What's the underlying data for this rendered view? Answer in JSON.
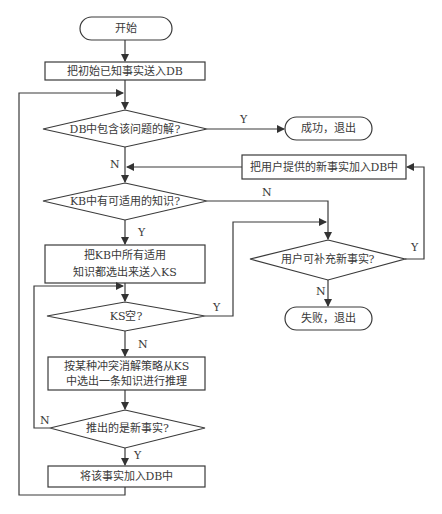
{
  "flowchart": {
    "nodes": {
      "start": {
        "type": "terminal",
        "text": "开始"
      },
      "init_facts": {
        "type": "process",
        "text": "把初始已知事实送入DB"
      },
      "db_contains": {
        "type": "decision",
        "text": "DB中包含该问题的解?"
      },
      "success": {
        "type": "terminal",
        "text": "成功，退出"
      },
      "add_user_facts": {
        "type": "process",
        "text": "把用户提供的新事实加入DB中"
      },
      "kb_applicable": {
        "type": "decision",
        "text": "KB中有可适用的知识?"
      },
      "select_to_ks": {
        "type": "process",
        "line1": "把KB中所有适用",
        "line2": "知识都选出来送入KS"
      },
      "ks_empty": {
        "type": "decision",
        "text": "KS空?"
      },
      "resolve_conflict": {
        "type": "process",
        "line1": "按某种冲突消解策略从KS",
        "line2": "中选出一条知识进行推理"
      },
      "new_fact": {
        "type": "decision",
        "text": "推出的是新事实?"
      },
      "add_fact_db": {
        "type": "process",
        "text": "将该事实加入DB中"
      },
      "user_can_add": {
        "type": "decision",
        "text": "用户可补充新事实?"
      },
      "fail": {
        "type": "terminal",
        "text": "失败，退出"
      }
    },
    "edge_labels": {
      "db_yes": "Y",
      "db_no": "N",
      "kb_yes": "Y",
      "kb_no": "N",
      "ks_yes": "Y",
      "ks_no": "N",
      "new_yes": "Y",
      "new_no": "N",
      "user_yes": "Y",
      "user_no": "N"
    },
    "edges": [
      [
        "start",
        "init_facts"
      ],
      [
        "init_facts",
        "db_contains"
      ],
      [
        "db_contains",
        "success",
        "Y"
      ],
      [
        "db_contains",
        "kb_applicable",
        "N"
      ],
      [
        "add_user_facts",
        "kb_applicable"
      ],
      [
        "kb_applicable",
        "select_to_ks",
        "Y"
      ],
      [
        "kb_applicable",
        "user_can_add",
        "N"
      ],
      [
        "select_to_ks",
        "ks_empty"
      ],
      [
        "ks_empty",
        "user_can_add",
        "Y"
      ],
      [
        "ks_empty",
        "resolve_conflict",
        "N"
      ],
      [
        "resolve_conflict",
        "new_fact"
      ],
      [
        "new_fact",
        "add_fact_db",
        "Y"
      ],
      [
        "new_fact",
        "ks_empty",
        "N"
      ],
      [
        "add_fact_db",
        "db_contains"
      ],
      [
        "user_can_add",
        "add_user_facts",
        "Y"
      ],
      [
        "user_can_add",
        "fail",
        "N"
      ]
    ]
  },
  "colors": {
    "stroke": "#3a3a3a",
    "background": "#ffffff",
    "text": "#3a3a3a"
  }
}
